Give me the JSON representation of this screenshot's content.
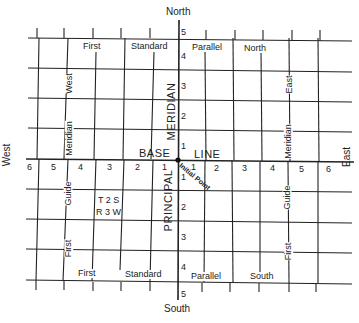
{
  "directions": {
    "north": "North",
    "south": "South",
    "east": "East",
    "west": "West"
  },
  "base_line": {
    "word1": "BASE",
    "word2": "LINE"
  },
  "principal_meridian": {
    "word1": "PRINCIPAL",
    "word2": "MERIDIAN"
  },
  "initial_point": "Initial Point",
  "north_parallel": {
    "w1": "First",
    "w2": "Standard",
    "w3": "Parallel",
    "w4": "North"
  },
  "south_parallel": {
    "w1": "First",
    "w2": "Standard",
    "w3": "Parallel",
    "w4": "South"
  },
  "west_guide_upper": {
    "w1": "West",
    "w2": "Meridian"
  },
  "west_guide_lower": {
    "w1": "Guide",
    "w2": "First"
  },
  "east_guide_upper": {
    "w1": "East",
    "w2": "Meridian"
  },
  "east_guide_lower": {
    "w1": "Guide",
    "w2": "First"
  },
  "township_label": {
    "line1": "T 2 S",
    "line2": "R 3 W"
  },
  "range_numbers_west": [
    "6",
    "5",
    "4",
    "3",
    "2",
    "1"
  ],
  "range_numbers_east": [
    "1",
    "2",
    "3",
    "4",
    "5",
    "6"
  ],
  "township_numbers_north": [
    "5",
    "4",
    "3",
    "2",
    "1"
  ],
  "township_numbers_south": [
    "1",
    "2",
    "3",
    "4",
    "5"
  ]
}
